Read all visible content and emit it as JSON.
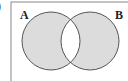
{
  "diagram": {
    "type": "venn",
    "prefix": ")",
    "shaded_region": "symmetric difference (A Δ B)",
    "sets": [
      {
        "label": "A",
        "cx": 51,
        "cy": 41,
        "r": 29
      },
      {
        "label": "B",
        "cx": 90,
        "cy": 41,
        "r": 29
      }
    ],
    "colors": {
      "fill": "#dcdcdc",
      "stroke": "#555555",
      "universe_border": "#888888",
      "background": "#ffffff"
    }
  }
}
